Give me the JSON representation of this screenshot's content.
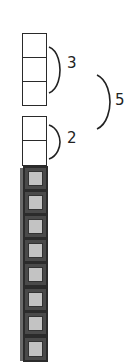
{
  "diagram": {
    "groups": [
      {
        "id": "top-group",
        "cells": 3,
        "bracket_label": "3"
      },
      {
        "id": "middle-group",
        "cells": 2,
        "bracket_label": "2"
      },
      {
        "id": "filled-group",
        "cells": 8
      }
    ],
    "outer_bracket_label": "5",
    "colors": {
      "outline": "#2a2a2a",
      "filled_border": "#2b2b2b",
      "filled_ring": "#4a4a4a",
      "filled_fill": "#c3c3c3"
    }
  }
}
